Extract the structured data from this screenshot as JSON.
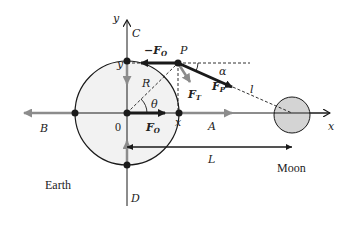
{
  "diagram": {
    "labels": {
      "y_axis": "y",
      "x_axis": "x",
      "point_c": "C",
      "point_p": "P",
      "point_a": "A",
      "point_b": "B",
      "point_d": "D",
      "origin": "0",
      "y_mark": "y",
      "x_mark": "x",
      "radius": "R",
      "theta": "θ",
      "alpha": "α",
      "distance_l": "l",
      "distance_L": "L",
      "force_neg_fo_minus": "−F",
      "force_neg_fo_sub": "O",
      "force_fo": "F",
      "force_fo_sub": "O",
      "force_ft": "F",
      "force_ft_sub": "T",
      "force_fp": "F",
      "force_fp_sub": "P"
    },
    "bodies": {
      "earth": "Earth",
      "moon": "Moon"
    },
    "colors": {
      "earth_fill": "#f2f2f2",
      "moon_fill": "#d4d4d4",
      "line": "#1a1a1a",
      "gray_arrow": "#8c8c8c"
    }
  }
}
